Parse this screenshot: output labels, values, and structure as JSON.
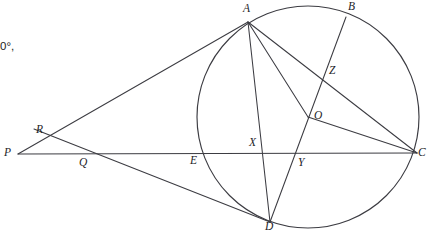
{
  "figure": {
    "type": "geometry-diagram",
    "width": 428,
    "height": 231,
    "background_color": "#ffffff",
    "stroke_color": "#3c3c42",
    "label_color": "#232327"
  },
  "annotations": {
    "angle_note": "0°,"
  },
  "circle": {
    "name": "main-circle",
    "center_label": "O",
    "cx": 308,
    "cy": 117,
    "r": 111
  },
  "points": [
    {
      "id": "A",
      "label": "A",
      "x": 248,
      "y": 22,
      "label_x": 243,
      "label_y": 3,
      "on_circle": true
    },
    {
      "id": "B",
      "label": "B",
      "x": 346,
      "y": 17,
      "label_x": 348,
      "label_y": 1,
      "on_circle": true
    },
    {
      "id": "C",
      "label": "C",
      "x": 417,
      "y": 153,
      "label_x": 418,
      "label_y": 147,
      "on_circle": true
    },
    {
      "id": "D",
      "label": "D",
      "x": 270,
      "y": 222,
      "label_x": 265,
      "label_y": 221,
      "on_circle": true
    },
    {
      "id": "E",
      "label": "E",
      "x": 197,
      "y": 153,
      "label_x": 190,
      "label_y": 155,
      "on_circle": true
    },
    {
      "id": "O",
      "label": "O",
      "x": 308,
      "y": 117,
      "label_x": 314,
      "label_y": 110,
      "on_circle": false
    },
    {
      "id": "P",
      "label": "P",
      "x": 18,
      "y": 154,
      "label_x": 4,
      "label_y": 147,
      "on_circle": false
    },
    {
      "id": "Q",
      "label": "Q",
      "x": 84,
      "y": 154,
      "label_x": 79,
      "label_y": 157,
      "on_circle": false
    },
    {
      "id": "R",
      "label": "R",
      "x": 45,
      "y": 140,
      "label_x": 36,
      "label_y": 124,
      "on_circle": false
    },
    {
      "id": "X",
      "label": "X",
      "x": 262,
      "y": 153,
      "label_x": 249,
      "label_y": 137,
      "on_circle": false
    },
    {
      "id": "Y",
      "label": "Y",
      "x": 297,
      "y": 154,
      "label_x": 298,
      "label_y": 157,
      "on_circle": false
    },
    {
      "id": "Z",
      "label": "Z",
      "x": 323,
      "y": 72,
      "label_x": 329,
      "label_y": 65,
      "on_circle": false
    }
  ],
  "segments": [
    {
      "name": "segment-P-A",
      "from": "P",
      "to": "A",
      "x1": 18,
      "y1": 154,
      "x2": 248,
      "y2": 22
    },
    {
      "name": "segment-P-C",
      "from": "P",
      "to": "C",
      "x1": 18,
      "y1": 154,
      "x2": 417,
      "y2": 153
    },
    {
      "name": "segment-R-D",
      "from": "R",
      "to": "D",
      "x1": 34,
      "y1": 129,
      "x2": 270,
      "y2": 222
    },
    {
      "name": "segment-A-D",
      "from": "A",
      "to": "D",
      "x1": 248,
      "y1": 22,
      "x2": 270,
      "y2": 222
    },
    {
      "name": "segment-A-C",
      "from": "A",
      "to": "C",
      "x1": 248,
      "y1": 22,
      "x2": 417,
      "y2": 153
    },
    {
      "name": "segment-A-O-Y",
      "from": "A",
      "to": "Y",
      "x1": 248,
      "y1": 22,
      "x2": 308,
      "y2": 117
    },
    {
      "name": "segment-B-D",
      "from": "B",
      "to": "D",
      "x1": 346,
      "y1": 17,
      "x2": 270,
      "y2": 222
    },
    {
      "name": "segment-O-C",
      "from": "O",
      "to": "C",
      "x1": 308,
      "y1": 117,
      "x2": 417,
      "y2": 153
    }
  ]
}
